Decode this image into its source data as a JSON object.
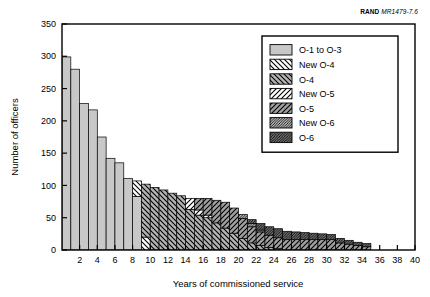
{
  "figure": {
    "source_prefix": "RAND",
    "source_id": "MR1479-7.6"
  },
  "chart_data": {
    "type": "bar",
    "stacked": true,
    "title": "",
    "xlabel": "Years of commissioned service",
    "ylabel": "Number of officers",
    "xlim": [
      0,
      40
    ],
    "ylim": [
      0,
      350
    ],
    "xticks": [
      2,
      4,
      6,
      8,
      10,
      12,
      14,
      16,
      18,
      20,
      22,
      24,
      26,
      28,
      30,
      32,
      34,
      36,
      38,
      40
    ],
    "yticks": [
      0,
      50,
      100,
      150,
      200,
      250,
      300,
      350
    ],
    "grid": false,
    "legend_position": "top-right",
    "x": [
      1,
      2,
      3,
      4,
      5,
      6,
      7,
      8,
      9,
      10,
      11,
      12,
      13,
      14,
      15,
      16,
      17,
      18,
      19,
      20,
      21,
      22,
      23,
      24,
      25,
      26,
      27,
      28,
      29,
      30,
      31,
      32,
      33,
      34,
      35
    ],
    "categories": [
      "1",
      "2",
      "3",
      "4",
      "5",
      "6",
      "7",
      "8",
      "9",
      "10",
      "11",
      "12",
      "13",
      "14",
      "15",
      "16",
      "17",
      "18",
      "19",
      "20",
      "21",
      "22",
      "23",
      "24",
      "25",
      "26",
      "27",
      "28",
      "29",
      "30",
      "31",
      "32",
      "33",
      "34",
      "35"
    ],
    "series": [
      {
        "name": "O-1 to O-3",
        "fill": "#c8c8c8",
        "hatch": "none",
        "values": [
          299,
          280,
          227,
          217,
          175,
          142,
          135,
          111,
          83,
          0,
          0,
          0,
          0,
          0,
          0,
          0,
          0,
          0,
          0,
          0,
          0,
          0,
          0,
          0,
          0,
          0,
          0,
          0,
          0,
          0,
          0,
          0,
          0,
          0,
          0
        ]
      },
      {
        "name": "New O-4",
        "fill": "#ffffff",
        "hatch": "backslash",
        "values": [
          0,
          0,
          0,
          0,
          0,
          0,
          0,
          0,
          24,
          20,
          0,
          0,
          0,
          0,
          0,
          0,
          0,
          0,
          0,
          0,
          0,
          0,
          0,
          0,
          0,
          0,
          0,
          0,
          0,
          0,
          0,
          0,
          0,
          0,
          0
        ]
      },
      {
        "name": "O-4",
        "fill": "#b4b4b4",
        "hatch": "backslash",
        "values": [
          0,
          0,
          0,
          0,
          0,
          0,
          0,
          0,
          0,
          82,
          97,
          93,
          88,
          84,
          63,
          54,
          50,
          42,
          34,
          26,
          18,
          11,
          7,
          4,
          2,
          0,
          0,
          0,
          0,
          0,
          0,
          0,
          0,
          0,
          0
        ]
      },
      {
        "name": "New O-5",
        "fill": "#ffffff",
        "hatch": "slash",
        "values": [
          0,
          0,
          0,
          0,
          0,
          0,
          0,
          0,
          0,
          0,
          0,
          0,
          0,
          0,
          17,
          8,
          4,
          0,
          0,
          0,
          0,
          0,
          0,
          0,
          0,
          0,
          0,
          0,
          0,
          0,
          0,
          0,
          0,
          0,
          0
        ]
      },
      {
        "name": "O-5",
        "fill": "#a0a0a0",
        "hatch": "slash",
        "values": [
          0,
          0,
          0,
          0,
          0,
          0,
          0,
          0,
          0,
          0,
          0,
          0,
          0,
          0,
          0,
          18,
          26,
          35,
          40,
          39,
          31,
          25,
          21,
          19,
          17,
          16,
          16,
          16,
          16,
          16,
          16,
          11,
          9,
          7,
          5
        ]
      },
      {
        "name": "New O-6",
        "fill": "#ffffff",
        "hatch": "dense",
        "values": [
          0,
          0,
          0,
          0,
          0,
          0,
          0,
          0,
          0,
          0,
          0,
          0,
          0,
          0,
          0,
          0,
          0,
          0,
          0,
          0,
          6,
          5,
          3,
          0,
          0,
          0,
          0,
          0,
          0,
          0,
          0,
          0,
          0,
          0,
          0
        ]
      },
      {
        "name": "O-6",
        "fill": "#989898",
        "hatch": "dense",
        "values": [
          0,
          0,
          0,
          0,
          0,
          0,
          0,
          0,
          0,
          0,
          0,
          0,
          0,
          0,
          0,
          0,
          0,
          0,
          0,
          0,
          0,
          6,
          10,
          13,
          14,
          13,
          12,
          11,
          10,
          9,
          8,
          7,
          6,
          5,
          5
        ]
      }
    ]
  },
  "legend": {
    "items": [
      {
        "label": "O-1 to O-3"
      },
      {
        "label": "New O-4"
      },
      {
        "label": "O-4"
      },
      {
        "label": "New O-5"
      },
      {
        "label": "O-5"
      },
      {
        "label": "New O-6"
      },
      {
        "label": "O-6"
      }
    ]
  }
}
